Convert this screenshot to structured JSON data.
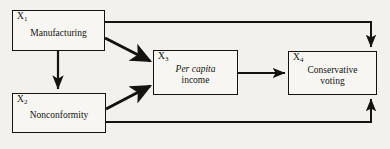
{
  "diagram": {
    "type": "path-diagram",
    "background_color": "#f2f1ee",
    "line_color": "#14130f",
    "nodes": [
      {
        "id": "x1",
        "tag": "X",
        "subscript": "1",
        "label": "Manufacturing",
        "label_italic": "",
        "label_plain": "Manufacturing"
      },
      {
        "id": "x2",
        "tag": "X",
        "subscript": "2",
        "label": "Nonconformity",
        "label_italic": "",
        "label_plain": "Nonconformity"
      },
      {
        "id": "x3",
        "tag": "X",
        "subscript": "3",
        "label": "Per capita income",
        "label_italic": "Per capita",
        "label_plain": "income"
      },
      {
        "id": "x4",
        "tag": "X",
        "subscript": "4",
        "label": "Conservative voting",
        "label_italic": "",
        "label_plain_line1": "Conservative",
        "label_plain_line2": "voting"
      }
    ],
    "edges": [
      {
        "from": "x1",
        "to": "x2",
        "style": "straight-vertical",
        "weight": "medium"
      },
      {
        "from": "x1",
        "to": "x3",
        "style": "diagonal",
        "weight": "thick"
      },
      {
        "from": "x2",
        "to": "x3",
        "style": "diagonal",
        "weight": "thick"
      },
      {
        "from": "x3",
        "to": "x4",
        "style": "straight-horizontal",
        "weight": "medium"
      },
      {
        "from": "x1",
        "to": "x4",
        "style": "routed-over-top",
        "weight": "medium"
      },
      {
        "from": "x2",
        "to": "x4",
        "style": "routed-under-bottom",
        "weight": "medium"
      }
    ]
  }
}
